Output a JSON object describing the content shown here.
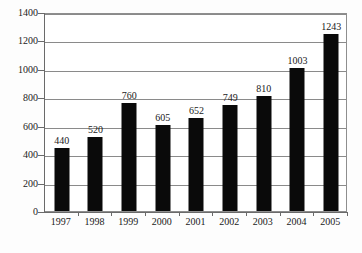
{
  "chart_data": {
    "type": "bar",
    "title": "",
    "subtitle": "",
    "xlabel": "",
    "ylabel": "",
    "categories": [
      "1997",
      "1998",
      "1999",
      "2000",
      "2001",
      "2002",
      "2003",
      "2004",
      "2005"
    ],
    "values": [
      440,
      520,
      760,
      605,
      652,
      749,
      810,
      1003,
      1243
    ],
    "data_labels": [
      "440",
      "520",
      "760",
      "605",
      "652",
      "749",
      "810",
      "1003",
      "1243"
    ],
    "ylim": [
      0,
      1400
    ],
    "y_ticks": [
      0,
      200,
      400,
      600,
      800,
      1000,
      1200,
      1400
    ],
    "y_tick_labels": [
      "0",
      "200",
      "400",
      "600",
      "800",
      "1000",
      "1200",
      "1400"
    ],
    "grid": true,
    "grid_axis": "y",
    "legend": false,
    "legend_position": "none",
    "annotations": [],
    "colors": {
      "bar": "#0a0a0a",
      "grid": "#8a8a8a",
      "axis": "#6a6a6a",
      "text": "#1a1a1a",
      "background": "#ffffff"
    }
  }
}
